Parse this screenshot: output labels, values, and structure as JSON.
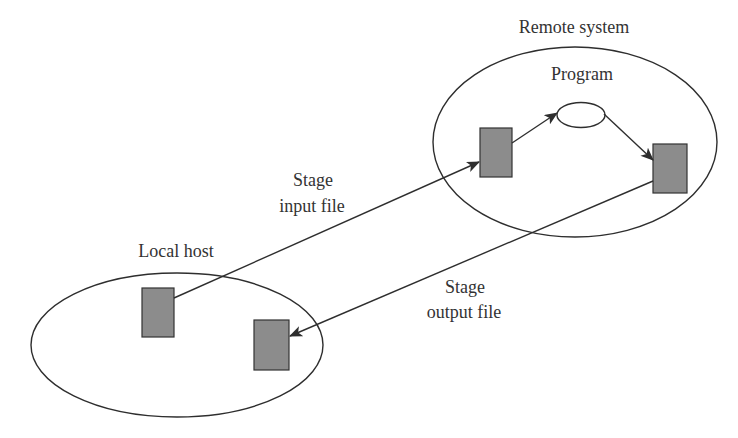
{
  "diagram": {
    "type": "file-staging",
    "colors": {
      "background": "#ffffff",
      "stroke": "#2e2e2e",
      "file_fill": "#8c8c8c",
      "text": "#333333"
    },
    "regions": {
      "remote": {
        "label": "Remote system"
      },
      "local": {
        "label": "Local host"
      }
    },
    "program": {
      "label": "Program"
    },
    "edges": {
      "stage_input": {
        "line1": "Stage",
        "line2": "input file"
      },
      "stage_output": {
        "line1": "Stage",
        "line2": "output file"
      }
    }
  }
}
